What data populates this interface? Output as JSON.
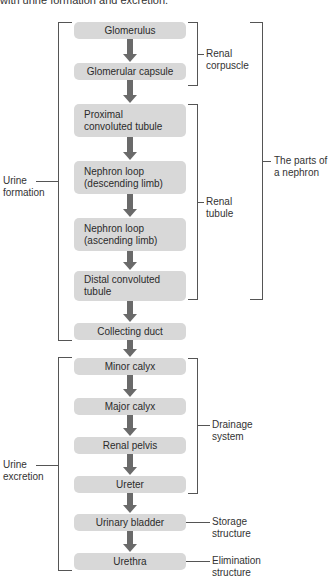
{
  "caption": "with urine formation and excretion.",
  "steps": [
    {
      "label": "Glomerulus"
    },
    {
      "label": "Glomerular capsule"
    },
    {
      "label": "Proximal",
      "label2": "convoluted tubule"
    },
    {
      "label": "Nephron loop",
      "label2": "(descending limb)"
    },
    {
      "label": "Nephron loop",
      "label2": "(ascending limb)"
    },
    {
      "label": "Distal convoluted",
      "label2": "tubule"
    },
    {
      "label": "Collecting duct"
    },
    {
      "label": "Minor calyx"
    },
    {
      "label": "Major calyx"
    },
    {
      "label": "Renal pelvis"
    },
    {
      "label": "Ureter"
    },
    {
      "label": "Urinary bladder"
    },
    {
      "label": "Urethra"
    }
  ],
  "brackets": {
    "renal_corpuscle": {
      "line1": "Renal",
      "line2": "corpuscle"
    },
    "renal_tubule": {
      "line1": "Renal",
      "line2": "tubule"
    },
    "nephron_parts": {
      "line1": "The parts of",
      "line2": "a nephron"
    },
    "urine_formation": {
      "line1": "Urine",
      "line2": "formation"
    },
    "urine_excretion": {
      "line1": "Urine",
      "line2": "excretion"
    },
    "drainage_system": {
      "line1": "Drainage",
      "line2": "system"
    },
    "storage_structure": {
      "line1": "Storage",
      "line2": "structure"
    },
    "elimination_structure": {
      "line1": "Elimination",
      "line2": "structure"
    }
  },
  "colors": {
    "box": "#d8d8d8",
    "arrow": "#6a6a6a",
    "line": "#555555"
  }
}
